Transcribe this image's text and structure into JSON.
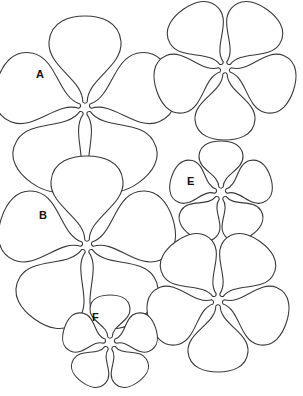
{
  "stroke_color": "#3a3a3a",
  "background": "#ffffff",
  "flowers": [
    {
      "id": "A",
      "label": "A",
      "cx": 85,
      "cy": 108,
      "petal_len": 92,
      "petal_w": 36,
      "rotation": 0,
      "label_x": 36,
      "label_y": 78
    },
    {
      "id": "top-right",
      "label": "",
      "cx": 225,
      "cy": 68,
      "petal_len": 72,
      "petal_w": 30,
      "rotation": 36,
      "label_x": 0,
      "label_y": 0
    },
    {
      "id": "B",
      "label": "B",
      "cx": 87,
      "cy": 246,
      "petal_len": 90,
      "petal_w": 36,
      "rotation": 0,
      "label_x": 39,
      "label_y": 219
    },
    {
      "id": "E",
      "label": "E",
      "cx": 221,
      "cy": 193,
      "petal_len": 52,
      "petal_w": 22,
      "rotation": 0,
      "label_x": 187,
      "label_y": 185
    },
    {
      "id": "bottom-right",
      "label": "",
      "cx": 218,
      "cy": 300,
      "petal_len": 72,
      "petal_w": 30,
      "rotation": 36,
      "label_x": 0,
      "label_y": 0
    },
    {
      "id": "F",
      "label": "F",
      "cx": 110,
      "cy": 343,
      "petal_len": 48,
      "petal_w": 20,
      "rotation": 0,
      "label_x": 92,
      "label_y": 321
    }
  ]
}
